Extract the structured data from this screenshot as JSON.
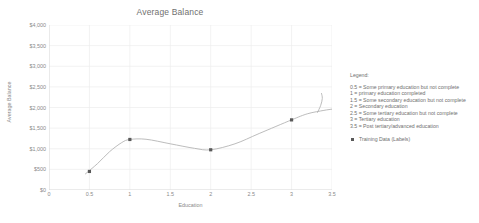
{
  "chart_data": {
    "type": "scatter",
    "title": "Average Balance",
    "xlabel": "Education",
    "ylabel": "Average Balance",
    "xlim": [
      0,
      3.5
    ],
    "ylim": [
      0,
      4000
    ],
    "grid": true,
    "legend_position": "right",
    "x_ticks": [
      "0",
      "0.5",
      "1",
      "1.5",
      "2",
      "2.5",
      "3",
      "3.5"
    ],
    "x_tick_values": [
      0,
      0.5,
      1,
      1.5,
      2,
      2.5,
      3,
      3.5
    ],
    "y_ticks": [
      "$0",
      "$500",
      "$1,000",
      "$1,500",
      "$2,000",
      "$2,500",
      "$3,000",
      "$3,500",
      "$4,000"
    ],
    "y_tick_values": [
      0,
      500,
      1000,
      1500,
      2000,
      2500,
      3000,
      3500,
      4000
    ],
    "series": [
      {
        "name": "Training Data (Labels)",
        "marker": "square",
        "color": "#595959",
        "points": [
          {
            "x": 0.5,
            "y": 450
          },
          {
            "x": 1.0,
            "y": 1225
          },
          {
            "x": 2.0,
            "y": 975
          },
          {
            "x": 3.0,
            "y": 1700
          }
        ]
      },
      {
        "name": "Fitted curve",
        "marker": "none",
        "color": "#b0b0b0",
        "points": [
          {
            "x": 0.45,
            "y": 390
          },
          {
            "x": 0.6,
            "y": 640
          },
          {
            "x": 0.75,
            "y": 930
          },
          {
            "x": 0.9,
            "y": 1150
          },
          {
            "x": 1.0,
            "y": 1225
          },
          {
            "x": 1.2,
            "y": 1230
          },
          {
            "x": 1.5,
            "y": 1120
          },
          {
            "x": 1.8,
            "y": 1010
          },
          {
            "x": 2.0,
            "y": 975
          },
          {
            "x": 2.3,
            "y": 1120
          },
          {
            "x": 2.6,
            "y": 1370
          },
          {
            "x": 3.0,
            "y": 1700
          },
          {
            "x": 3.2,
            "y": 1850
          },
          {
            "x": 3.4,
            "y": 1930
          },
          {
            "x": 3.5,
            "y": 1960
          }
        ]
      },
      {
        "name": "Extrapolation spike",
        "marker": "none",
        "color": "#b0b0b0",
        "points": [
          {
            "x": 3.32,
            "y": 1880
          },
          {
            "x": 3.36,
            "y": 2050
          },
          {
            "x": 3.38,
            "y": 2220
          },
          {
            "x": 3.37,
            "y": 2340
          }
        ]
      }
    ]
  },
  "legend": {
    "heading": "Legend:",
    "entries": [
      "0.5 = Some primary education but not complete",
      "1 = primary education completed",
      "1.5 = Some secondary education but not complete",
      "2 = Secondary education",
      "2.5 = Some tertiary education but not complete",
      "3 = Tertiary education",
      "3.5 = Post tertiary/advanced education"
    ],
    "series_label": "Training Data (Labels)"
  }
}
